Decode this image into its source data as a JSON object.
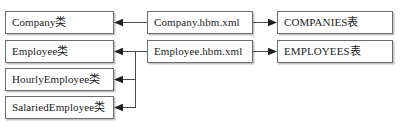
{
  "diagram": {
    "type": "mapping-diagram",
    "columns": [
      {
        "id": "persistent-classes",
        "nodes": [
          {
            "id": "company-class",
            "label": "Company类"
          },
          {
            "id": "employee-class",
            "label": "Employee类"
          },
          {
            "id": "hourly-employee-class",
            "label": "HourlyEmployee类"
          },
          {
            "id": "salaried-employee-class",
            "label": "SalariedEmployee类"
          }
        ]
      },
      {
        "id": "mapping-files",
        "nodes": [
          {
            "id": "company-hbm-xml",
            "label": "Company.hbm.xml"
          },
          {
            "id": "employee-hbm-xml",
            "label": "Employee.hbm.xml"
          }
        ]
      },
      {
        "id": "database-tables",
        "nodes": [
          {
            "id": "companies-table",
            "label": "COMPANIES表"
          },
          {
            "id": "employees-table",
            "label": "EMPLOYEES表"
          }
        ]
      }
    ],
    "connections": [
      {
        "id": "company-hbm-to-company-class",
        "from": "company-hbm-xml",
        "to": "company-class",
        "direction": "left"
      },
      {
        "id": "company-hbm-to-companies-table",
        "from": "company-hbm-xml",
        "to": "companies-table",
        "direction": "right"
      },
      {
        "id": "employee-hbm-to-employee-class",
        "from": "employee-hbm-xml",
        "to": "employee-class",
        "direction": "left"
      },
      {
        "id": "employee-hbm-to-hourly-class",
        "from": "employee-hbm-xml",
        "to": "hourly-employee-class",
        "direction": "left"
      },
      {
        "id": "employee-hbm-to-salaried-class",
        "from": "employee-hbm-xml",
        "to": "salaried-employee-class",
        "direction": "left"
      },
      {
        "id": "employee-hbm-to-employees-table",
        "from": "employee-hbm-xml",
        "to": "employees-table",
        "direction": "right"
      }
    ],
    "colors": {
      "background": "#ffffff",
      "box_border": "#6d6d6d",
      "connector": "#4a4a4a",
      "text": "#1a1a1a"
    }
  }
}
